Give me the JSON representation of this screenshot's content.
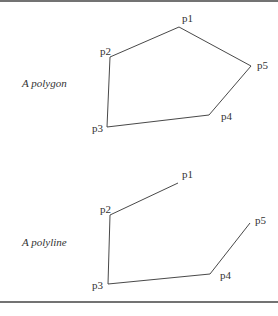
{
  "figure": {
    "top_rule_y": 1,
    "bottom_rule_y": 302,
    "stroke_color": "#333333"
  },
  "polygon": {
    "caption": "A polygon",
    "caption_pos": [
      22,
      87
    ],
    "points": [
      {
        "label": "p1",
        "x": 179,
        "y": 27,
        "lx": 182,
        "ly": 22
      },
      {
        "label": "p2",
        "x": 110,
        "y": 57,
        "lx": 100,
        "ly": 55
      },
      {
        "label": "p3",
        "x": 107,
        "y": 127,
        "lx": 92,
        "ly": 132
      },
      {
        "label": "p4",
        "x": 209,
        "y": 115,
        "lx": 221,
        "ly": 120
      },
      {
        "label": "p5",
        "x": 251,
        "y": 66,
        "lx": 257,
        "ly": 69
      }
    ],
    "closed": true
  },
  "polyline": {
    "caption": "A polyline",
    "caption_pos": [
      22,
      246
    ],
    "points": [
      {
        "label": "p1",
        "x": 178,
        "y": 183,
        "lx": 182,
        "ly": 178
      },
      {
        "label": "p2",
        "x": 110,
        "y": 215,
        "lx": 100,
        "ly": 213
      },
      {
        "label": "p3",
        "x": 108,
        "y": 284,
        "lx": 92,
        "ly": 289
      },
      {
        "label": "p4",
        "x": 210,
        "y": 274,
        "lx": 220,
        "ly": 279
      },
      {
        "label": "p5",
        "x": 250,
        "y": 223,
        "lx": 255,
        "ly": 224
      }
    ],
    "closed": false
  }
}
